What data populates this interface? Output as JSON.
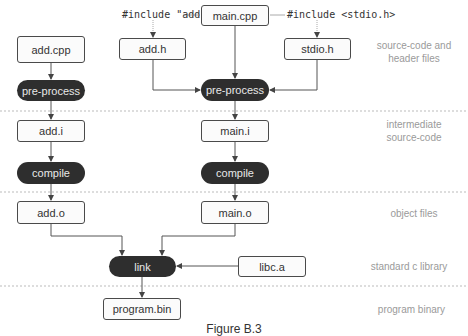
{
  "includes": {
    "add_h": "#include \"add.h\"",
    "stdio_h": "#include <stdio.h>"
  },
  "nodes": {
    "main_cpp": "main.cpp",
    "add_cpp": "add.cpp",
    "add_h": "add.h",
    "stdio_h": "stdio.h",
    "preprocess_left": "pre-process",
    "preprocess_mid": "pre-process",
    "add_i": "add.i",
    "main_i": "main.i",
    "compile_left": "compile",
    "compile_mid": "compile",
    "add_o": "add.o",
    "main_o": "main.o",
    "link": "link",
    "libc_a": "libc.a",
    "program_bin": "program.bin"
  },
  "stage_labels": {
    "source": [
      "source-code and",
      "header files"
    ],
    "intermediate": [
      "intermediate",
      "source-code"
    ],
    "object": [
      "object files"
    ],
    "library": [
      "standard c library"
    ],
    "binary": [
      "program binary"
    ]
  },
  "caption": "Figure B.3",
  "colors": {
    "process_fill": "#2e2e2e",
    "box_border": "#4a4a4a",
    "label_gray": "#9a9a9a",
    "dotted_line": "#bbbbbb"
  }
}
